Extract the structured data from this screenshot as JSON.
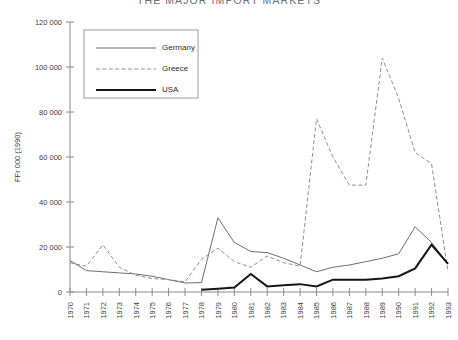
{
  "chart_title": "THE MAJOR IMPORT MARKETS",
  "legend": {
    "position": "top-left-inside",
    "entries": [
      {
        "label": "Germany",
        "style": "thin-solid",
        "color": "#6f6f6f"
      },
      {
        "label": "Greece",
        "style": "dashed",
        "color": "#8f8f8f"
      },
      {
        "label": "USA",
        "style": "thick-solid",
        "color": "#151515"
      }
    ]
  },
  "axes": {
    "y_title": "FFr 000 (1990)",
    "y_ticks": [
      "0",
      "20 000",
      "40 000",
      "60 000",
      "80 000",
      "100 000",
      "120 000"
    ],
    "x_ticks": [
      "1970",
      "1971",
      "1972",
      "1973",
      "1974",
      "1975",
      "1976",
      "1977",
      "1978",
      "1979",
      "1980",
      "1981",
      "1982",
      "1983",
      "1984",
      "1985",
      "1986",
      "1987",
      "1988",
      "1989",
      "1990",
      "1991",
      "1992",
      "1993"
    ]
  },
  "chart_data": {
    "type": "line",
    "title": "THE MAJOR IMPORT MARKETS",
    "xlabel": "",
    "ylabel": "FFr 000 (1990)",
    "ylim": [
      0,
      120000
    ],
    "ytick_step": 20000,
    "grid": false,
    "legend_position": "upper left (inside plot)",
    "categories": [
      1970,
      1971,
      1972,
      1973,
      1974,
      1975,
      1976,
      1977,
      1978,
      1979,
      1980,
      1981,
      1982,
      1983,
      1984,
      1985,
      1986,
      1987,
      1988,
      1989,
      1990,
      1991,
      1992,
      1993
    ],
    "series": [
      {
        "name": "Germany",
        "color": "#6f6f6f",
        "style": "thin-solid",
        "values": [
          14000,
          9500,
          9000,
          8500,
          8000,
          7000,
          5500,
          4000,
          4200,
          33000,
          22000,
          18000,
          17500,
          15000,
          12000,
          9000,
          11000,
          12000,
          13500,
          15000,
          17000,
          29000,
          22000,
          12500
        ]
      },
      {
        "name": "Greece",
        "color": "#8f8f8f",
        "style": "dashed",
        "values": [
          13000,
          11500,
          21000,
          11000,
          7500,
          6000,
          5500,
          4500,
          14500,
          19500,
          13500,
          11000,
          16000,
          13000,
          11500,
          77000,
          60000,
          47500,
          47500,
          104000,
          86000,
          62000,
          57000,
          9000
        ]
      },
      {
        "name": "USA",
        "color": "#151515",
        "style": "thick-solid",
        "values": [
          null,
          null,
          null,
          null,
          null,
          null,
          null,
          null,
          1000,
          1500,
          2000,
          8000,
          2500,
          3000,
          3500,
          2500,
          5500,
          5500,
          5500,
          6000,
          7000,
          10500,
          21000,
          12500
        ]
      }
    ]
  }
}
